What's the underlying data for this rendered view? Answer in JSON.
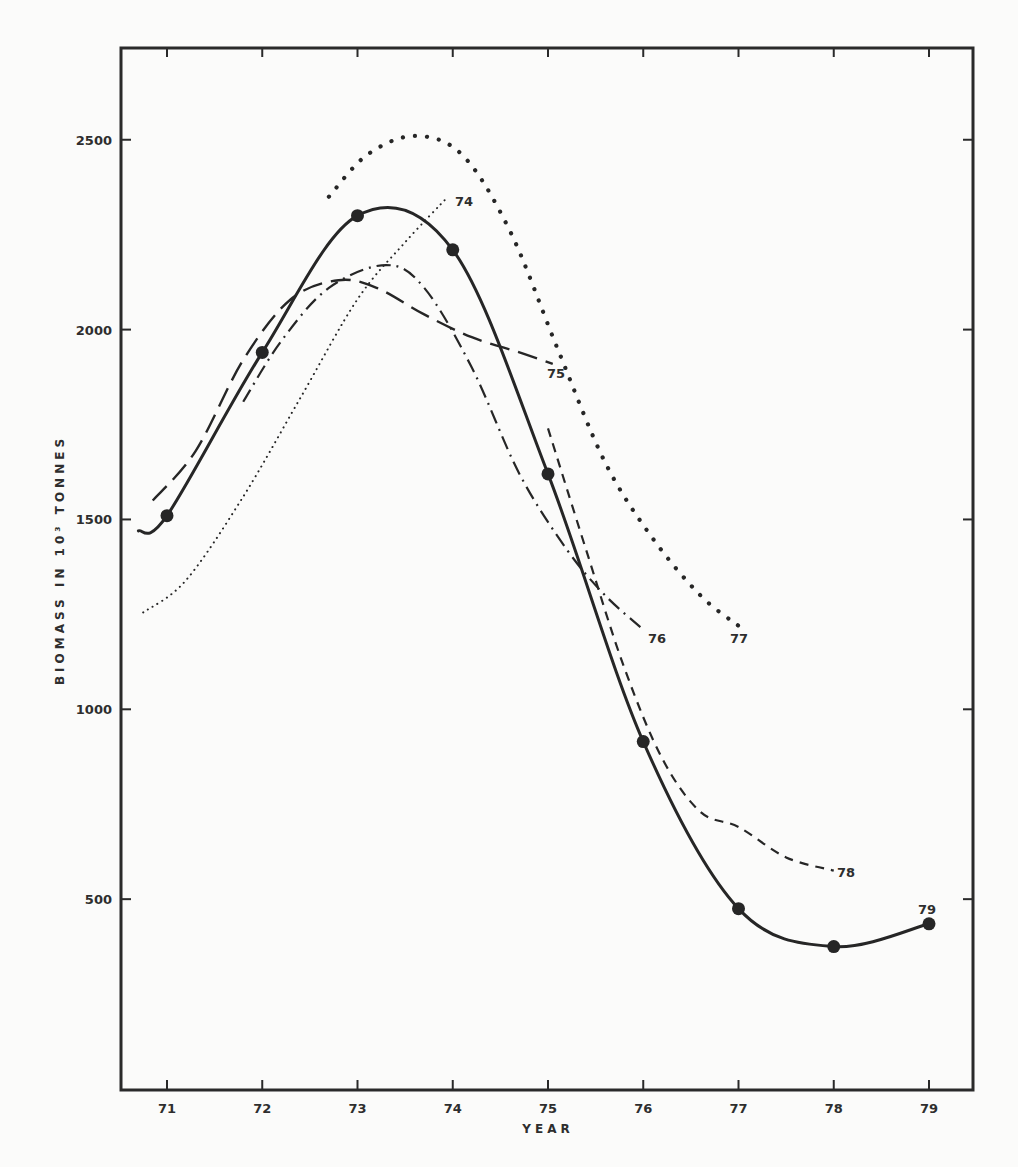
{
  "chart_data": {
    "type": "line",
    "title": "",
    "xlabel": "YEAR",
    "ylabel": "BIOMASS IN 10³ TONNES",
    "xlim": [
      70.5,
      79.5
    ],
    "ylim": [
      0,
      2750
    ],
    "grid": false,
    "legend": "none (curves labelled inline by year)",
    "x_ticks": [
      "71",
      "72",
      "73",
      "74",
      "75",
      "76",
      "77",
      "78",
      "79"
    ],
    "y_ticks": [
      "500",
      "1000",
      "1500",
      "2000",
      "2500"
    ],
    "series": [
      {
        "name": "Observed biomass",
        "style": "solid-with-markers",
        "label": "79",
        "x": [
          70.7,
          71,
          72,
          73,
          74,
          75,
          76,
          77,
          78,
          79
        ],
        "values": [
          1470,
          1510,
          1940,
          2300,
          2210,
          1620,
          915,
          475,
          375,
          435
        ],
        "markers": [
          71,
          72,
          73,
          74,
          75,
          76,
          77,
          78,
          79
        ]
      },
      {
        "name": "Estimate 74",
        "style": "fine-dotted",
        "label": "74",
        "x": [
          70.75,
          71.2,
          71.8,
          72.4,
          73.0,
          73.5,
          73.95
        ],
        "values": [
          1255,
          1340,
          1560,
          1820,
          2080,
          2230,
          2350
        ]
      },
      {
        "name": "Estimate 75",
        "style": "long-dash",
        "label": "75",
        "x": [
          70.85,
          71.3,
          71.8,
          72.3,
          72.8,
          73.2,
          73.7,
          74.2,
          74.7,
          75.05
        ],
        "values": [
          1550,
          1680,
          1920,
          2080,
          2130,
          2110,
          2040,
          1980,
          1940,
          1910
        ]
      },
      {
        "name": "Estimate 76",
        "style": "dash-dot",
        "label": "76",
        "x": [
          71.8,
          72.2,
          72.7,
          73.3,
          73.7,
          74.2,
          74.7,
          75.2,
          75.6,
          76.0
        ],
        "values": [
          1810,
          1970,
          2110,
          2170,
          2110,
          1900,
          1620,
          1420,
          1300,
          1210
        ]
      },
      {
        "name": "Estimate 77",
        "style": "heavy-dotted",
        "label": "77",
        "x": [
          72.7,
          73.1,
          73.6,
          74.1,
          74.6,
          75.1,
          75.6,
          76.1,
          76.6,
          77.0
        ],
        "values": [
          2350,
          2460,
          2510,
          2460,
          2260,
          1950,
          1650,
          1450,
          1300,
          1220
        ]
      },
      {
        "name": "Estimate 78",
        "style": "short-dash",
        "label": "78",
        "x": [
          75.0,
          75.4,
          75.8,
          76.2,
          76.6,
          77.0,
          77.5,
          78.0
        ],
        "values": [
          1740,
          1420,
          1110,
          870,
          730,
          690,
          610,
          575
        ]
      }
    ]
  }
}
